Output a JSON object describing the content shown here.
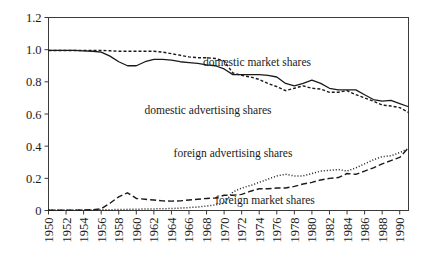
{
  "chart_data": {
    "type": "line",
    "title": "",
    "xlabel": "",
    "ylabel": "",
    "xlim": [
      1950,
      1991
    ],
    "ylim": [
      0,
      1.2
    ],
    "grid": false,
    "legend_position": "inline-annotations",
    "yticks": [
      "0",
      "0.2",
      "0.4",
      "0.6",
      "0.8",
      "1.0",
      "1.2"
    ],
    "ytick_values": [
      0,
      0.2,
      0.4,
      0.6,
      0.8,
      1.0,
      1.2
    ],
    "xticks": [
      "1950",
      "1952",
      "1954",
      "1956",
      "1958",
      "1960",
      "1962",
      "1964",
      "1966",
      "1968",
      "1970",
      "1972",
      "1974",
      "1976",
      "1978",
      "1980",
      "1982",
      "1984",
      "1986",
      "1988",
      "1990"
    ],
    "x": [
      1950,
      1951,
      1952,
      1953,
      1954,
      1955,
      1956,
      1957,
      1958,
      1959,
      1960,
      1961,
      1962,
      1963,
      1964,
      1965,
      1966,
      1967,
      1968,
      1969,
      1970,
      1971,
      1972,
      1973,
      1974,
      1975,
      1976,
      1977,
      1978,
      1979,
      1980,
      1981,
      1982,
      1983,
      1984,
      1985,
      1986,
      1987,
      1988,
      1989,
      1990,
      1991
    ],
    "series": [
      {
        "name": "domestic market shares",
        "style": "solid",
        "values": [
          0.995,
          0.995,
          0.995,
          0.995,
          0.993,
          0.99,
          0.985,
          0.96,
          0.925,
          0.9,
          0.9,
          0.925,
          0.94,
          0.94,
          0.935,
          0.925,
          0.92,
          0.915,
          0.905,
          0.9,
          0.88,
          0.845,
          0.845,
          0.845,
          0.845,
          0.84,
          0.83,
          0.79,
          0.775,
          0.79,
          0.81,
          0.79,
          0.76,
          0.75,
          0.75,
          0.75,
          0.72,
          0.69,
          0.68,
          0.685,
          0.665,
          0.645
        ]
      },
      {
        "name": "domestic advertising shares",
        "style": "dashed-fine",
        "values": [
          0.995,
          0.995,
          0.995,
          0.995,
          0.995,
          0.995,
          0.995,
          0.993,
          0.99,
          0.99,
          0.99,
          0.99,
          0.99,
          0.985,
          0.975,
          0.965,
          0.955,
          0.95,
          0.95,
          0.945,
          0.93,
          0.855,
          0.84,
          0.83,
          0.815,
          0.79,
          0.77,
          0.745,
          0.76,
          0.775,
          0.76,
          0.755,
          0.735,
          0.735,
          0.745,
          0.72,
          0.7,
          0.68,
          0.655,
          0.65,
          0.64,
          0.61
        ]
      },
      {
        "name": "foreign advertising shares",
        "style": "dotted",
        "values": [
          0.003,
          0.003,
          0.003,
          0.003,
          0.003,
          0.003,
          0.004,
          0.005,
          0.006,
          0.007,
          0.008,
          0.009,
          0.01,
          0.011,
          0.012,
          0.015,
          0.018,
          0.022,
          0.028,
          0.035,
          0.045,
          0.115,
          0.14,
          0.155,
          0.175,
          0.195,
          0.215,
          0.225,
          0.215,
          0.215,
          0.23,
          0.245,
          0.25,
          0.255,
          0.245,
          0.265,
          0.29,
          0.315,
          0.335,
          0.34,
          0.36,
          0.385
        ]
      },
      {
        "name": "foreign market shares",
        "style": "dashed",
        "values": [
          0.002,
          0.002,
          0.002,
          0.002,
          0.003,
          0.005,
          0.01,
          0.045,
          0.085,
          0.11,
          0.075,
          0.07,
          0.065,
          0.06,
          0.058,
          0.06,
          0.065,
          0.07,
          0.075,
          0.078,
          0.095,
          0.095,
          0.1,
          0.12,
          0.135,
          0.135,
          0.14,
          0.14,
          0.15,
          0.165,
          0.175,
          0.19,
          0.2,
          0.205,
          0.23,
          0.225,
          0.245,
          0.265,
          0.29,
          0.31,
          0.33,
          0.39
        ]
      }
    ],
    "annotations": [
      {
        "text": "domestic market shares",
        "x_px": 257,
        "y_px": 66
      },
      {
        "text": "domestic advertising shares",
        "x_px": 208,
        "y_px": 114
      },
      {
        "text": "foreign advertising shares",
        "x_px": 233,
        "y_px": 157
      },
      {
        "text": "foreign market shares",
        "x_px": 265,
        "y_px": 204
      }
    ]
  }
}
